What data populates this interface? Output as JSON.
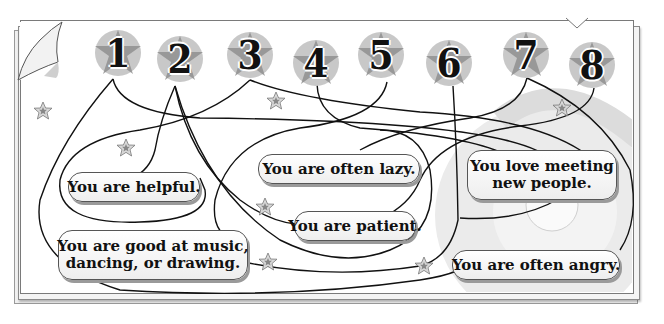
{
  "numbers": [
    {
      "label": "1",
      "x": 93,
      "y": 28
    },
    {
      "label": "2",
      "x": 155,
      "y": 34
    },
    {
      "label": "3",
      "x": 225,
      "y": 30
    },
    {
      "label": "4",
      "x": 291,
      "y": 38
    },
    {
      "label": "5",
      "x": 356,
      "y": 30
    },
    {
      "label": "6",
      "x": 424,
      "y": 38
    },
    {
      "label": "7",
      "x": 501,
      "y": 30
    },
    {
      "label": "8",
      "x": 567,
      "y": 40
    }
  ],
  "statements": [
    {
      "id": "helpful",
      "line1": "You are helpful.",
      "line2": ""
    },
    {
      "id": "lazy",
      "line1": "You are often lazy.",
      "line2": ""
    },
    {
      "id": "meeting",
      "line1": "You love meeting",
      "line2": "new people."
    },
    {
      "id": "patient",
      "line1": "You are patient.",
      "line2": ""
    },
    {
      "id": "music",
      "line1": "You are good at music,",
      "line2": "dancing, or drawing."
    },
    {
      "id": "angry",
      "line1": "You are often angry.",
      "line2": ""
    }
  ],
  "colors": {
    "line": "#111111",
    "badge_dark": "#8c8c8c",
    "badge_light": "#c8c8c8",
    "star": "#9a9a9a",
    "label_border": "#555555",
    "label_shadow": "#9a9a9a",
    "circle_bg": "#e6e6e6"
  }
}
